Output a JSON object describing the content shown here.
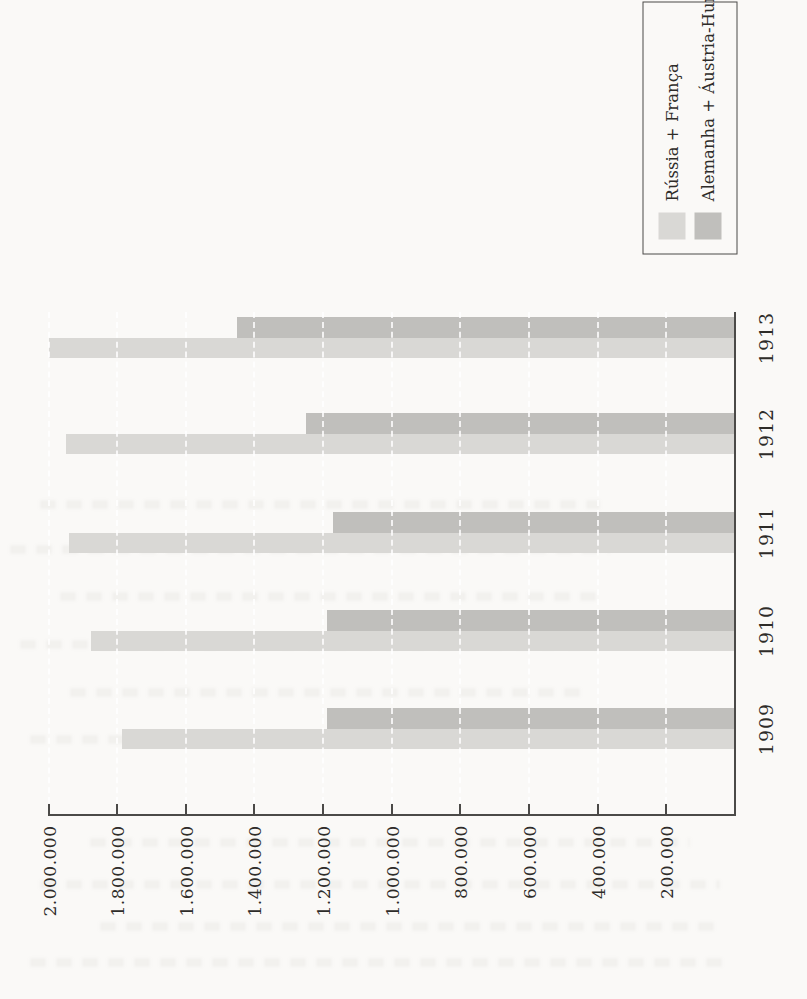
{
  "page": {
    "background": "#faf9f7",
    "axis_color": "#4b4a48",
    "text_color": "#2e2c29"
  },
  "chart_data": {
    "type": "bar",
    "orientation": "grouped column chart printed rotated 90 degrees counter-clockwise on the book page",
    "categories": [
      "1909",
      "1910",
      "1911",
      "1912",
      "1913"
    ],
    "series": [
      {
        "name": "Rússia + França",
        "color": "#d9d8d5",
        "values": [
          1785000,
          1875000,
          1940000,
          1950000,
          2000000
        ]
      },
      {
        "name": "Alemanha + Áustria-Hungria",
        "color": "#c0bfbc",
        "values": [
          1190000,
          1190000,
          1170000,
          1250000,
          1450000
        ]
      }
    ],
    "value_axis": {
      "min": 0,
      "max": 2000000,
      "tick_interval": 200000,
      "tick_labels": [
        "2.000.000",
        "1.800.000",
        "1.600.000",
        "1.400.000",
        "1.200.000",
        "1.000.000",
        "800.000",
        "600.000",
        "400.000",
        "200.000"
      ]
    },
    "grid": "white dashed gridlines at each value tick, visible across the bars",
    "legend": {
      "position": "top-right of rotated page",
      "entries": [
        "Rússia + França",
        "Alemanha + Áustria-Hungria"
      ]
    }
  }
}
